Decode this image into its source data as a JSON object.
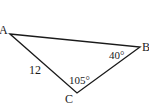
{
  "diagram": {
    "type": "triangle",
    "vertices": [
      {
        "name": "A",
        "x": 10,
        "y": 34
      },
      {
        "name": "B",
        "x": 140,
        "y": 47
      },
      {
        "name": "C",
        "x": 77,
        "y": 93
      }
    ],
    "labels": {
      "vertex_a": "A",
      "vertex_b": "B",
      "vertex_c": "C",
      "side_ac": "12",
      "angle_b": "40°",
      "angle_c": "105°"
    },
    "stroke_color": "#1a1a1a"
  }
}
